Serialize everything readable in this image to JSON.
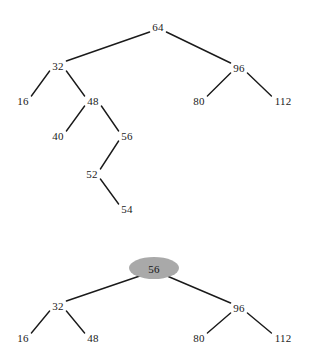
{
  "figure": {
    "background_color": "#ffffff",
    "edge_color": "#1a1a1a",
    "text_color": "#1a1a1a",
    "highlight_color": "#a9a9a9",
    "width": 310,
    "height": 349
  },
  "chart_data": {
    "type": "diagram",
    "diagram_type": "binary-tree",
    "title": "",
    "panels": [
      {
        "name": "tree-before",
        "root": "64",
        "nodes": [
          {
            "id": "n64",
            "label": "64",
            "x": 158,
            "y": 27,
            "highlighted": false
          },
          {
            "id": "n32",
            "label": "32",
            "x": 58,
            "y": 66,
            "highlighted": false
          },
          {
            "id": "n96",
            "label": "96",
            "x": 239,
            "y": 68,
            "highlighted": false
          },
          {
            "id": "n16",
            "label": "16",
            "x": 23,
            "y": 101,
            "highlighted": false
          },
          {
            "id": "n48",
            "label": "48",
            "x": 93,
            "y": 101,
            "highlighted": false
          },
          {
            "id": "n80",
            "label": "80",
            "x": 199,
            "y": 101,
            "highlighted": false
          },
          {
            "id": "n112",
            "label": "112",
            "x": 283,
            "y": 101,
            "highlighted": false
          },
          {
            "id": "n40",
            "label": "40",
            "x": 58,
            "y": 136,
            "highlighted": false
          },
          {
            "id": "n56",
            "label": "56",
            "x": 127,
            "y": 136,
            "highlighted": false
          },
          {
            "id": "n52",
            "label": "52",
            "x": 92,
            "y": 174,
            "highlighted": false
          },
          {
            "id": "n54",
            "label": "54",
            "x": 127,
            "y": 209,
            "highlighted": false
          }
        ],
        "edges": [
          {
            "from": "n64",
            "to": "n32"
          },
          {
            "from": "n64",
            "to": "n96"
          },
          {
            "from": "n32",
            "to": "n16"
          },
          {
            "from": "n32",
            "to": "n48"
          },
          {
            "from": "n96",
            "to": "n80"
          },
          {
            "from": "n96",
            "to": "n112"
          },
          {
            "from": "n48",
            "to": "n40"
          },
          {
            "from": "n48",
            "to": "n56"
          },
          {
            "from": "n56",
            "to": "n52"
          },
          {
            "from": "n52",
            "to": "n54"
          }
        ]
      },
      {
        "name": "tree-after",
        "root": "56",
        "nodes": [
          {
            "id": "m56",
            "label": "56",
            "x": 154,
            "y": 269,
            "highlighted": true
          },
          {
            "id": "m32",
            "label": "32",
            "x": 58,
            "y": 306,
            "highlighted": false
          },
          {
            "id": "m96",
            "label": "96",
            "x": 239,
            "y": 308,
            "highlighted": false
          },
          {
            "id": "m16",
            "label": "16",
            "x": 23,
            "y": 338,
            "highlighted": false
          },
          {
            "id": "m48",
            "label": "48",
            "x": 93,
            "y": 338,
            "highlighted": false
          },
          {
            "id": "m80",
            "label": "80",
            "x": 199,
            "y": 338,
            "highlighted": false
          },
          {
            "id": "m112",
            "label": "112",
            "x": 283,
            "y": 338,
            "highlighted": false
          }
        ],
        "edges": [
          {
            "from": "m56",
            "to": "m32"
          },
          {
            "from": "m56",
            "to": "m96"
          },
          {
            "from": "m32",
            "to": "m16"
          },
          {
            "from": "m32",
            "to": "m48"
          },
          {
            "from": "m96",
            "to": "m80"
          },
          {
            "from": "m96",
            "to": "m112"
          }
        ],
        "highlight": {
          "node_id": "m56",
          "shape": "ellipse",
          "cx": 154,
          "cy": 268,
          "rx": 25,
          "ry": 11,
          "color": "#a9a9a9"
        }
      }
    ]
  }
}
